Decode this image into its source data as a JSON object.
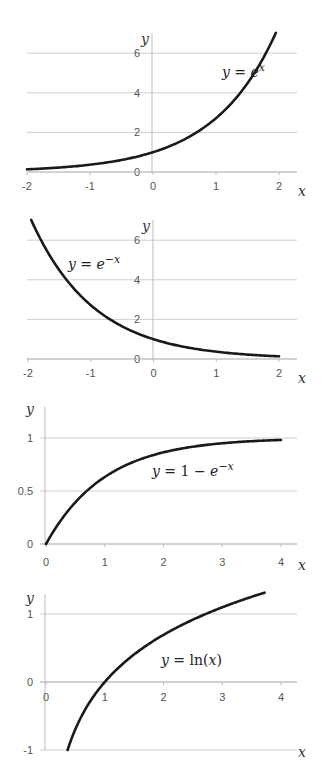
{
  "chart_data": [
    {
      "type": "line",
      "title": "",
      "equation": "y = e^x",
      "equation_parts": {
        "lhs": "y",
        "eq": " = ",
        "base": "e",
        "sup": "x"
      },
      "xlabel": "x",
      "ylabel": "y",
      "xlim": [
        -2,
        2
      ],
      "ylim": [
        0,
        7
      ],
      "xticks": [
        -2,
        -1,
        0,
        1,
        2
      ],
      "yticks": [
        0,
        2,
        4,
        6
      ],
      "grid": "horizontal",
      "function": "exp",
      "domain": [
        -2,
        1.95
      ],
      "x": [
        -2,
        -1.5,
        -1,
        -0.5,
        0,
        0.5,
        1,
        1.5,
        1.95
      ],
      "values": [
        0.14,
        0.22,
        0.37,
        0.61,
        1.0,
        1.65,
        2.72,
        4.48,
        7.03
      ],
      "frame": {
        "top": 33,
        "bottom": 172,
        "left": 27,
        "right": 297,
        "x0": 27,
        "x1": 279,
        "y0px": 172,
        "yunit": 19.8,
        "yaxis_top": 33,
        "yaxis_x": 152
      },
      "label_pos": {
        "x": 222,
        "y": 77
      },
      "xlabel_pos": {
        "x": 298,
        "y": 196
      },
      "ylabel_pos": {
        "x": 141,
        "y": 44
      },
      "xtick_y": 190,
      "ytick_x": 140
    },
    {
      "type": "line",
      "title": "",
      "equation": "y = e^-x",
      "equation_parts": {
        "lhs": "y",
        "eq": " = ",
        "base": "e",
        "sup": "−x"
      },
      "xlabel": "x",
      "ylabel": "y",
      "xlim": [
        -2,
        2
      ],
      "ylim": [
        0,
        7
      ],
      "xticks": [
        -2,
        -1,
        0,
        1,
        2
      ],
      "yticks": [
        0,
        2,
        4,
        6
      ],
      "grid": "horizontal",
      "function": "expneg",
      "domain": [
        -1.95,
        2
      ],
      "x": [
        -1.95,
        -1.5,
        -1,
        -0.5,
        0,
        0.5,
        1,
        1.5,
        2
      ],
      "values": [
        7.03,
        4.48,
        2.72,
        1.65,
        1.0,
        0.61,
        0.37,
        0.22,
        0.14
      ],
      "frame": {
        "top": 220,
        "bottom": 359,
        "left": 27,
        "right": 297,
        "x0": 28,
        "x1": 279,
        "y0px": 359,
        "yunit": 19.8,
        "yaxis_top": 220,
        "yaxis_x": 153
      },
      "label_pos": {
        "x": 68,
        "y": 269
      },
      "xlabel_pos": {
        "x": 298,
        "y": 383
      },
      "ylabel_pos": {
        "x": 142,
        "y": 231
      },
      "xtick_y": 377,
      "ytick_x": 140
    },
    {
      "type": "line",
      "title": "",
      "equation": "y = 1 − e^-x",
      "equation_parts": {
        "lhs": "y",
        "eq": " = 1 − ",
        "base": "e",
        "sup": "−x"
      },
      "xlabel": "x",
      "ylabel": "y",
      "xlim": [
        0,
        4
      ],
      "ylim": [
        0,
        1.3
      ],
      "xticks": [
        0,
        1,
        2,
        3,
        4
      ],
      "yticks": [
        0,
        0.5,
        1
      ],
      "grid": "horizontal",
      "function": "oneminus",
      "domain": [
        0,
        4
      ],
      "x": [
        0,
        0.5,
        1,
        1.5,
        2,
        2.5,
        3,
        3.5,
        4
      ],
      "values": [
        0,
        0.39,
        0.63,
        0.78,
        0.86,
        0.92,
        0.95,
        0.97,
        0.98
      ],
      "frame": {
        "top": 407,
        "bottom": 544,
        "left": 40,
        "right": 297,
        "x0": 46,
        "x1": 281,
        "y0px": 544,
        "yunit": 106,
        "yaxis_top": 407,
        "yaxis_x": 45
      },
      "label_pos": {
        "x": 152,
        "y": 476
      },
      "xlabel_pos": {
        "x": 298,
        "y": 570
      },
      "ylabel_pos": {
        "x": 26,
        "y": 414
      },
      "xtick_y": 566,
      "ytick_x": 33
    },
    {
      "type": "line",
      "title": "",
      "equation": "y = ln(x)",
      "equation_parts": {
        "lhs": "y",
        "eq": " = ln(",
        "base": "x",
        "sup": "",
        "tail": ")"
      },
      "xlabel": "x",
      "ylabel": "y",
      "xlim": [
        0,
        4
      ],
      "ylim": [
        -1,
        1.3
      ],
      "xticks": [
        0,
        1,
        2,
        3,
        4
      ],
      "yticks": [
        -1,
        0,
        1
      ],
      "grid": "horizontal",
      "function": "ln",
      "domain": [
        0.368,
        3.72
      ],
      "x": [
        0.37,
        0.5,
        1,
        1.5,
        2,
        2.5,
        3,
        3.5,
        3.72
      ],
      "values": [
        -1.0,
        -0.69,
        0,
        0.41,
        0.69,
        0.92,
        1.1,
        1.25,
        1.31
      ],
      "frame": {
        "top": 594,
        "bottom": 750,
        "left": 40,
        "right": 297,
        "x0": 46,
        "x1": 281,
        "y0px": 682,
        "yunit": 68,
        "yaxis_top": 594,
        "yaxis_x": 45
      },
      "label_pos": {
        "x": 161,
        "y": 665
      },
      "xlabel_pos": {
        "x": 298,
        "y": 757
      },
      "ylabel_pos": {
        "x": 26,
        "y": 603
      },
      "xtick_y": 701,
      "ytick_x": 33
    }
  ]
}
